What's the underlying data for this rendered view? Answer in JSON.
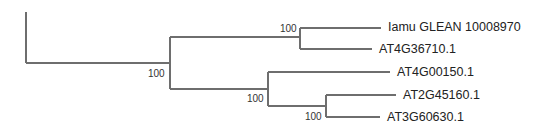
{
  "diagram": {
    "type": "phylogenetic-tree",
    "line_color": "#6e6e6e",
    "leaves": [
      {
        "label": "Iamu GLEAN 10008970"
      },
      {
        "label": "AT4G36710.1"
      },
      {
        "label": "AT4G00150.1"
      },
      {
        "label": "AT2G45160.1"
      },
      {
        "label": "AT3G60630.1"
      }
    ],
    "bootstrap": [
      {
        "node": "root-split",
        "value": "100"
      },
      {
        "node": "clade-glean-at4g36710",
        "value": "100"
      },
      {
        "node": "clade-at4g00150-group",
        "value": "100"
      },
      {
        "node": "clade-at2g45160-at3g60630",
        "value": "100"
      }
    ],
    "newick": "((Iamu_GLEAN_10008970,AT4G36710.1)100,(AT4G00150.1,(AT2G45160.1,AT3G60630.1)100)100)100;"
  }
}
